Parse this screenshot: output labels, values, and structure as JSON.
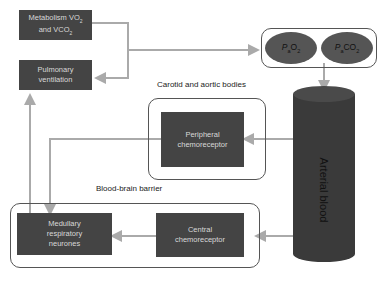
{
  "boxes": {
    "metabolism": {
      "line1": "Metabolism VO",
      "sub1": "2",
      "line2": "and VCO",
      "sub2": "2"
    },
    "pulmonary": {
      "line1": "Pulmonary",
      "line2": "ventilation"
    },
    "peripheral": {
      "line1": "Peripheral",
      "line2": "chemoreceptor"
    },
    "medullary": {
      "line1": "Medullary",
      "line2": "respiratory",
      "line3": "neurones"
    },
    "central": {
      "line1": "Central",
      "line2": "chemoreceptor"
    }
  },
  "gases": {
    "pao2": {
      "p": "P",
      "psub": "a",
      "gas": "O",
      "gsub": "2"
    },
    "paco2": {
      "p": "P",
      "psub": "a",
      "gas": "CO",
      "gsub": "2"
    }
  },
  "labels": {
    "carotid": "Carotid and aortic bodies",
    "bbb": "Blood-brain barrier",
    "arterial": "Arterial blood"
  },
  "colors": {
    "box_fill": "#444444",
    "box_text": "#d8d8d8",
    "arrow": "#aaaaaa",
    "cylinder": "#3a3a3a",
    "ellipse": "#555555"
  }
}
